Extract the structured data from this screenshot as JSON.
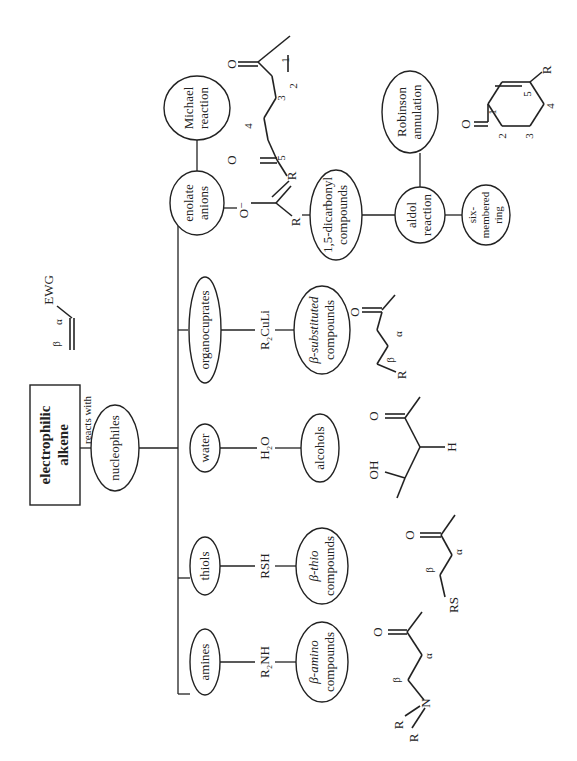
{
  "diagram": {
    "root": {
      "line1": "electrophilic",
      "line2": "alkene",
      "edge_label": "reacts with"
    },
    "root_structure": {
      "beta": "β",
      "alpha": "α",
      "ewg": "EWG"
    },
    "hub": {
      "label": "nucleophiles"
    },
    "nucleophiles": [
      {
        "id": "amines",
        "label": "amines",
        "reagent": "R₂NH",
        "product_line1": "β-amino",
        "product_line2": "compounds"
      },
      {
        "id": "thiols",
        "label": "thiols",
        "reagent": "RSH",
        "product_line1": "β-thio",
        "product_line2": "compounds"
      },
      {
        "id": "water",
        "label": "water",
        "reagent": "H₂O",
        "product_line1": "alcohols",
        "product_line2": ""
      },
      {
        "id": "organocuprates",
        "label": "organocuprates",
        "reagent": "R₂CuLi",
        "product_line1": "β-substituted",
        "product_line2": "compounds"
      },
      {
        "id": "enolate",
        "label_line1": "enolate",
        "label_line2": "anions",
        "reagent": "O⁻",
        "product_line1": "1,5-dicarbonyl",
        "product_line2": "compounds"
      }
    ],
    "michael": {
      "line1": "Michael",
      "line2": "reaction"
    },
    "aldol": {
      "line1": "aldol",
      "line2": "reaction"
    },
    "robinson": {
      "line1": "Robinson",
      "line2": "annulation"
    },
    "six_ring": {
      "line1": "six-",
      "line2": "membered",
      "line3": "ring"
    },
    "structures": {
      "amino": {
        "R1": "R",
        "R2": "R",
        "N": "N",
        "beta": "β",
        "alpha": "α",
        "O": "O"
      },
      "thio": {
        "RS": "RS",
        "beta": "β",
        "alpha": "α",
        "O": "O"
      },
      "alcohol": {
        "OH": "OH",
        "H": "H",
        "O": "O"
      },
      "cuprate": {
        "R": "R",
        "beta": "β",
        "alpha": "α",
        "O": "O"
      },
      "enolate": {
        "R": "R",
        "O": "O⁻"
      },
      "dicarbonyl": {
        "R": "R",
        "O1": "O",
        "O2": "O",
        "n1": "1",
        "n2": "2",
        "n3": "3",
        "n4": "4",
        "n5": "5"
      },
      "cyclohexenone": {
        "O": "O",
        "R": "R",
        "n1": "1",
        "n2": "2",
        "n3": "3",
        "n4": "4",
        "n5": "5"
      }
    }
  }
}
